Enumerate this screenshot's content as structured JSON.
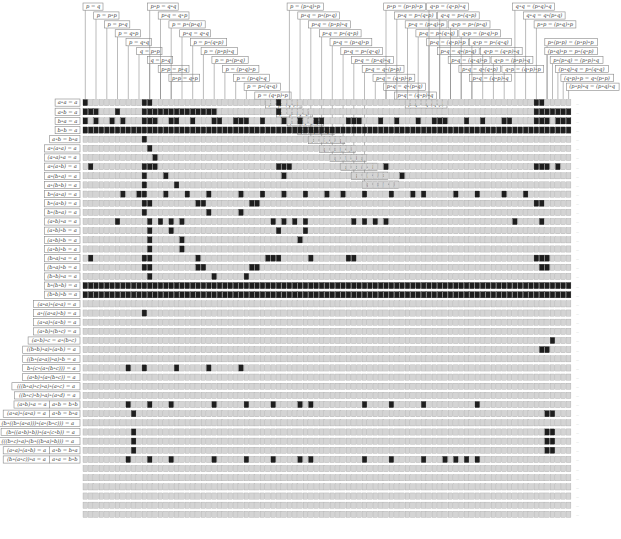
{
  "figure": {
    "grid": {
      "x0": 83,
      "y0": 99.5,
      "col_pitch": 5.37,
      "row_pitch": 9.15,
      "cols": 91,
      "cell_w": 4.6,
      "cell_h": 6.2
    },
    "colors": {
      "cell": "#d4d4d4",
      "cell_border": "#9a9a9a",
      "on": "#1e1e1e",
      "box_border": "#888888",
      "text": "#333333"
    }
  },
  "column_headers": [
    {
      "label": "p = q",
      "col": 0,
      "level": 0
    },
    {
      "label": "p = p∘p",
      "col": 2,
      "level": 1
    },
    {
      "label": "p = p∘q",
      "col": 4,
      "level": 2
    },
    {
      "label": "p = q∘p",
      "col": 6,
      "level": 3
    },
    {
      "label": "p = q∘q",
      "col": 8,
      "level": 4
    },
    {
      "label": "q = p∘p",
      "col": 10,
      "level": 5
    },
    {
      "label": "q = p∘q",
      "col": 12,
      "level": 6
    },
    {
      "label": "p∘p = p∘q",
      "col": 14,
      "level": 7
    },
    {
      "label": "p∘p = q∘p",
      "col": 16,
      "level": 8
    },
    {
      "label": "p∘p = q∘q",
      "col": 12,
      "level": 0
    },
    {
      "label": "p∘q = q∘p",
      "col": 14,
      "level": 1
    },
    {
      "label": "p = p∘(p∘q)",
      "col": 16,
      "level": 2
    },
    {
      "label": "p∘q = q∘q",
      "col": 18,
      "level": 3
    },
    {
      "label": "p = p∘(q∘p)",
      "col": 20,
      "level": 4
    },
    {
      "label": "p = (p∘p)∘q",
      "col": 22,
      "level": 5
    },
    {
      "label": "p = p∘(p∘q)",
      "col": 24,
      "level": 6
    },
    {
      "label": "p = (p∘q)∘p",
      "col": 26,
      "level": 7
    },
    {
      "label": "p = (p∘q)∘q",
      "col": 28,
      "level": 8
    },
    {
      "label": "p = p∘(q∘q)",
      "col": 30,
      "level": 9
    },
    {
      "label": "p = (q∘p)∘p",
      "col": 32,
      "level": 10
    },
    {
      "label": "p = p∘(q∘p)",
      "col": 34,
      "level": 11
    },
    {
      "label": "p = p∘(q∘q)",
      "col": 36,
      "level": 12
    },
    {
      "label": "p = (q∘q)∘p",
      "col": 38,
      "level": 13
    },
    {
      "label": "p = q∘(p∘q)",
      "col": 40,
      "level": 14
    },
    {
      "label": "p = (q∘p)∘q",
      "col": 42,
      "level": 15
    },
    {
      "label": "q = p∘(p∘q)",
      "col": 44,
      "level": 16
    },
    {
      "label": "q = (p∘p)∘q",
      "col": 46,
      "level": 17
    },
    {
      "label": "q = p∘(q∘p)",
      "col": 48,
      "level": 18
    },
    {
      "label": "q = (p∘q)∘p",
      "col": 50,
      "level": 19
    },
    {
      "label": "q = p∘(q∘q)",
      "col": 52,
      "level": 20
    },
    {
      "label": "p = (p∘q)∘p",
      "col": 38,
      "level": 0
    },
    {
      "label": "p∘q = p∘(p∘q)",
      "col": 40,
      "level": 1
    },
    {
      "label": "p∘q = (p∘p)∘q",
      "col": 42,
      "level": 2
    },
    {
      "label": "p∘q = p∘(q∘p)",
      "col": 44,
      "level": 3
    },
    {
      "label": "p∘q = (p∘q)∘p",
      "col": 46,
      "level": 4
    },
    {
      "label": "p∘q = p∘(q∘q)",
      "col": 48,
      "level": 5
    },
    {
      "label": "p∘q = (p∘q)∘q",
      "col": 50,
      "level": 6
    },
    {
      "label": "p∘q = q∘(p∘p)",
      "col": 52,
      "level": 7
    },
    {
      "label": "p∘q = (q∘p)∘p",
      "col": 54,
      "level": 8
    },
    {
      "label": "p∘q = q∘(p∘q)",
      "col": 56,
      "level": 9
    },
    {
      "label": "p∘q = (q∘p)∘q",
      "col": 58,
      "level": 10
    },
    {
      "label": "p∘q = q∘(q∘p)",
      "col": 60,
      "level": 11
    },
    {
      "label": "p∘p = (p∘p)∘p",
      "col": 56,
      "level": 0
    },
    {
      "label": "p∘q = p∘(q∘p)",
      "col": 58,
      "level": 1
    },
    {
      "label": "p∘q = (p∘q)∘p",
      "col": 60,
      "level": 2
    },
    {
      "label": "p∘q = p∘(q∘q)",
      "col": 62,
      "level": 3
    },
    {
      "label": "p∘q = (q∘p)∘p",
      "col": 64,
      "level": 4
    },
    {
      "label": "p∘q = q∘(p∘q)",
      "col": 66,
      "level": 5
    },
    {
      "label": "p∘q = (q∘q)∘p",
      "col": 68,
      "level": 6
    },
    {
      "label": "p∘q = q∘(q∘p)",
      "col": 70,
      "level": 7
    },
    {
      "label": "p∘q = (q∘p)∘q",
      "col": 72,
      "level": 8
    },
    {
      "label": "q∘p = (q∘p)∘q",
      "col": 64,
      "level": 0
    },
    {
      "label": "q∘q = p∘(q∘p)",
      "col": 66,
      "level": 1
    },
    {
      "label": "q∘p = p∘(p∘q)",
      "col": 68,
      "level": 2
    },
    {
      "label": "q∘p = (p∘q)∘p",
      "col": 70,
      "level": 3
    },
    {
      "label": "q∘p = p∘(q∘q)",
      "col": 72,
      "level": 4
    },
    {
      "label": "q∘p = (q∘p)∘q",
      "col": 74,
      "level": 5
    },
    {
      "label": "q∘p = (p∘p)∘q",
      "col": 76,
      "level": 6
    },
    {
      "label": "q∘p = (q∘p)∘p",
      "col": 78,
      "level": 7
    },
    {
      "label": "q∘q = (p∘q)∘q",
      "col": 80,
      "level": 0
    },
    {
      "label": "q∘q = q∘(p∘q)",
      "col": 82,
      "level": 1
    },
    {
      "label": "p∘p = (p∘q)∘p",
      "col": 84,
      "level": 2
    },
    {
      "label": "p∘(p∘p) = (p∘p)∘p",
      "col": 86,
      "level": 4
    },
    {
      "label": "(p∘q)∘p = p∘(q∘p)",
      "col": 86,
      "level": 5
    },
    {
      "label": "p∘(p∘q) = (p∘p)∘q",
      "col": 87,
      "level": 6
    },
    {
      "label": "(p∘q)∘q = p∘(q∘q)",
      "col": 88,
      "level": 7
    },
    {
      "label": "(q∘p)∘p = q∘(p∘p)",
      "col": 89,
      "level": 8
    },
    {
      "label": "(p∘p)∘q = (p∘q)∘q",
      "col": 90,
      "level": 9
    }
  ],
  "rows": [
    {
      "label": "a∘a = a",
      "on": [
        0,
        11,
        12,
        36,
        84,
        85
      ]
    },
    {
      "label": "a∘b = a",
      "on": [
        0,
        1,
        2,
        6,
        11,
        12,
        13,
        14,
        15,
        16,
        17,
        18,
        19,
        20,
        21,
        22,
        23,
        24,
        36,
        84,
        85,
        86,
        87,
        88,
        89,
        90
      ]
    },
    {
      "label": "b∘a = a",
      "on": [
        0,
        2,
        5,
        7,
        11,
        12,
        13,
        16,
        17,
        20,
        24,
        25,
        28,
        29,
        30,
        33,
        37,
        40,
        43,
        44,
        49,
        50,
        51,
        55,
        58,
        62,
        65,
        66,
        67,
        71,
        74,
        78,
        79,
        84,
        85,
        86,
        88,
        89,
        90
      ]
    },
    {
      "label": "b∘b = a",
      "on": "all"
    },
    {
      "label": "a∘b = b∘a",
      "on": [
        11
      ]
    },
    {
      "label": "a∘(a∘a) = a",
      "on": [
        12
      ]
    },
    {
      "label": "(a∘a)∘a = a",
      "on": [
        13
      ]
    },
    {
      "label": "a∘(a∘b) = a",
      "on": [
        1,
        11,
        12,
        13,
        36,
        37,
        38,
        56,
        84,
        85,
        86,
        88
      ]
    },
    {
      "label": "a∘(b∘a) = a",
      "on": [
        11,
        15,
        37,
        59
      ]
    },
    {
      "label": "a∘(b∘b) = a",
      "on": [
        11,
        17
      ]
    },
    {
      "label": "b∘(a∘a) = a",
      "on": [
        7,
        10,
        11,
        15,
        19,
        23,
        29,
        33,
        37,
        41,
        45,
        48,
        52,
        57,
        61,
        63,
        69,
        73,
        78,
        82
      ]
    },
    {
      "label": "b∘(a∘b) = a",
      "on": [
        11,
        12,
        21,
        22,
        31,
        32,
        84,
        85
      ]
    },
    {
      "label": "b∘(b∘a) = a",
      "on": [
        11,
        23,
        29
      ]
    },
    {
      "label": "(a∘b)∘a = a",
      "on": [
        6,
        12,
        14,
        16,
        18,
        35,
        37,
        39,
        41,
        50,
        52,
        54,
        56,
        80,
        85
      ]
    },
    {
      "label": "(a∘b)∘b = a",
      "on": [
        12,
        16,
        36,
        41
      ]
    },
    {
      "label": "(a∘b)∘b = a",
      "on": [
        12,
        18,
        40
      ]
    },
    {
      "label": "(a∘b)∘b = a",
      "on": [
        12,
        18
      ]
    },
    {
      "label": "(b∘a)∘a = a",
      "on": [
        1,
        11,
        12,
        21,
        34,
        35,
        36,
        42,
        49,
        50,
        84,
        85,
        86
      ]
    },
    {
      "label": "(b∘a)∘b = a",
      "on": [
        11,
        12,
        21,
        22,
        31,
        32,
        85,
        86
      ]
    },
    {
      "label": "(b∘b)∘a = a",
      "on": [
        12,
        24,
        30
      ]
    },
    {
      "label": "b∘(b∘b) = a",
      "on": "all"
    },
    {
      "label": "(b∘b)∘b = a",
      "on": "all"
    },
    {
      "label": "(a∘a)∘(a∘a) = a",
      "on": []
    },
    {
      "label": "a∘((a∘a)∘b) = a",
      "on": [
        11
      ]
    },
    {
      "label": "(a∘a)∘(a∘b) = a",
      "on": []
    },
    {
      "label": "(a∘b)∘(b∘c) = a",
      "on": []
    },
    {
      "label": "(a∘b)∘c = a∘(b∘c)",
      "on": [
        87
      ]
    },
    {
      "label": "((b∘b)∘a)∘(a∘b) = a",
      "on": [
        85,
        86
      ]
    },
    {
      "label": "((b∘(a∘a))∘a)∘b = a",
      "on": []
    },
    {
      "label": "b∘(c∘(a∘(b∘c))) = a",
      "on": [
        8,
        11,
        17,
        23,
        29
      ]
    },
    {
      "label": "(a∘b)∘(a∘(b∘c)) = a",
      "on": []
    },
    {
      "label": "(((b∘a)∘c)∘a)∘(a∘c) = a",
      "on": []
    },
    {
      "label": "((b∘c)∘b)∘a)∘(a∘d) = a",
      "on": []
    },
    {
      "label": "(a∘b)∘a = a | a∘b = b∘b",
      "on": [
        8,
        12,
        16,
        24,
        30,
        35,
        40,
        42,
        52,
        57,
        63,
        73
      ]
    },
    {
      "label": "(a∘a)∘(a∘a) = a | a∘b = b∘a",
      "on": [
        9,
        86,
        87
      ]
    },
    {
      "label": "(b∘((b∘(a∘a)))∘(a∘(b∘c))) = a",
      "on": []
    },
    {
      "label": "(b∘((a∘b)∘b))∘(a∘(c∘b)) = a",
      "on": [
        9,
        86,
        87
      ]
    },
    {
      "label": "(((b∘c)∘a)∘(b∘((b∘a)∘b))) = a",
      "on": [
        9,
        86,
        87
      ]
    },
    {
      "label": "(a∘a)∘(a∘b) = a | a∘b = b∘a",
      "on": [
        9,
        86,
        87
      ]
    },
    {
      "label": "(b∘(a∘c))∘a = a | a∘a = b∘b",
      "on": [
        8,
        12,
        16,
        24,
        30,
        35,
        40,
        42,
        52,
        57,
        63,
        67,
        69,
        71,
        73
      ]
    }
  ]
}
